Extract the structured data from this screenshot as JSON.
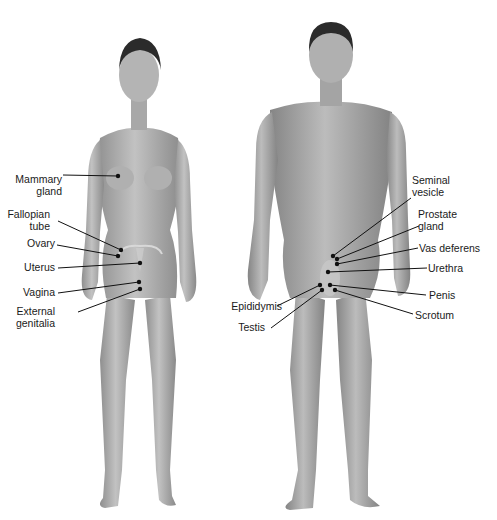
{
  "figure": {
    "female": {
      "labels": [
        {
          "id": "mammary-gland",
          "text": "Mammary\ngland",
          "x": 62,
          "y": 186,
          "align": "r",
          "line": [
            63,
            175,
            118,
            176
          ]
        },
        {
          "id": "fallopian-tube",
          "text": "Fallopian\ntube",
          "x": 50,
          "y": 221,
          "align": "r",
          "line": [
            58,
            221,
            121,
            250
          ]
        },
        {
          "id": "ovary",
          "text": "Ovary",
          "x": 55,
          "y": 244,
          "align": "r",
          "line": [
            57,
            245,
            118,
            256
          ]
        },
        {
          "id": "uterus",
          "text": "Uterus",
          "x": 55,
          "y": 268,
          "align": "r",
          "line": [
            58,
            268,
            140,
            263
          ]
        },
        {
          "id": "vagina",
          "text": "Vagina",
          "x": 55,
          "y": 293,
          "align": "r",
          "line": [
            58,
            293,
            139,
            282
          ]
        },
        {
          "id": "external-genitalia",
          "text": "External\ngenitalia",
          "x": 55,
          "y": 318,
          "align": "r",
          "line": [
            78,
            312,
            140,
            289
          ]
        }
      ]
    },
    "male": {
      "labels": [
        {
          "id": "seminal-vesicle",
          "text": "Seminal\nvesicle",
          "x": 412,
          "y": 187,
          "align": "l",
          "line": [
            411,
            198,
            333,
            256
          ]
        },
        {
          "id": "prostate-gland",
          "text": "Prostate\ngland",
          "x": 418,
          "y": 221,
          "align": "l",
          "line": [
            419,
            226,
            337,
            259
          ]
        },
        {
          "id": "vas-deferens",
          "text": "Vas deferens",
          "x": 419,
          "y": 249,
          "align": "l",
          "line": [
            418,
            248,
            337,
            264
          ]
        },
        {
          "id": "urethra",
          "text": "Urethra",
          "x": 428,
          "y": 269,
          "align": "l",
          "line": [
            427,
            268,
            328,
            272
          ]
        },
        {
          "id": "penis",
          "text": "Penis",
          "x": 429,
          "y": 296,
          "align": "l",
          "line": [
            426,
            295,
            330,
            285
          ]
        },
        {
          "id": "scrotum",
          "text": "Scrotum",
          "x": 415,
          "y": 316,
          "align": "l",
          "line": [
            413,
            314,
            335,
            290
          ]
        },
        {
          "id": "epididymis",
          "text": "Epididymis",
          "x": 282,
          "y": 307,
          "align": "r",
          "line": [
            277,
            306,
            320,
            285
          ]
        },
        {
          "id": "testis",
          "text": "Testis",
          "x": 265,
          "y": 328,
          "align": "r",
          "line": [
            271,
            328,
            322,
            290
          ]
        }
      ]
    }
  },
  "colors": {
    "background": "#ffffff",
    "skin_light": "#bdbdbd",
    "skin_mid": "#9e9e9e",
    "skin_dark": "#7a7a7a",
    "hair": "#2b2b2b",
    "leader": "#111111",
    "label_text": "#1a1a1a"
  }
}
